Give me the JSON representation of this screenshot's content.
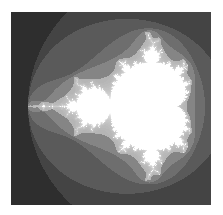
{
  "image": {
    "subject": "Mandelbrot set fractal",
    "style": "grayscale escape-time bands",
    "colors": {
      "outer": "#2e2e2e",
      "band1": "#444444",
      "band2": "#5a5a5a",
      "band3": "#6e6e6e",
      "band4": "#858585",
      "band5": "#9c9c9c",
      "set": "#ffffff"
    }
  }
}
